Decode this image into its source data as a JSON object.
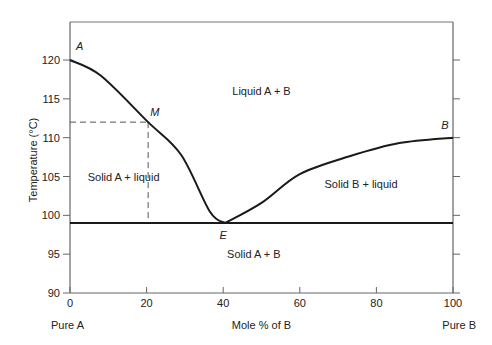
{
  "chart_data": {
    "type": "line",
    "title": "",
    "xlabel": "Mole % of B",
    "ylabel": "Temperature (°C)",
    "xlim": [
      0,
      100
    ],
    "ylim": [
      90,
      125
    ],
    "x_ticks": [
      0,
      20,
      40,
      60,
      80,
      100
    ],
    "y_ticks": [
      90,
      95,
      100,
      105,
      110,
      115,
      120
    ],
    "x_end_labels": {
      "left": "Pure A",
      "right": "Pure B"
    },
    "grid": false,
    "series": [
      {
        "name": "liquidus-A",
        "x": [
          0,
          8,
          20.4,
          29,
          36.5,
          40.5
        ],
        "y": [
          120,
          118,
          112,
          107.8,
          100.5,
          99
        ]
      },
      {
        "name": "liquidus-B",
        "x": [
          40.5,
          50,
          60,
          73,
          86,
          100
        ],
        "y": [
          99,
          101.6,
          105.3,
          107.6,
          109.3,
          110
        ]
      },
      {
        "name": "eutectic-line",
        "x": [
          0,
          100
        ],
        "y": [
          99,
          99
        ]
      }
    ],
    "reference_lines": {
      "M_temperature": 112,
      "M_composition": 20.4,
      "style": "dashed"
    },
    "points": [
      {
        "label": "A",
        "x": 0,
        "y": 120
      },
      {
        "label": "M",
        "x": 20.4,
        "y": 112
      },
      {
        "label": "E",
        "x": 40.5,
        "y": 99
      },
      {
        "label": "B",
        "x": 100,
        "y": 110
      }
    ],
    "regions": [
      {
        "label": "Liquid A + B",
        "x": 50,
        "y": 116
      },
      {
        "label": "Solid A + liquid",
        "x": 14,
        "y": 105
      },
      {
        "label": "Solid B + liquid",
        "x": 76,
        "y": 104
      },
      {
        "label": "Solid A + B",
        "x": 48,
        "y": 95
      }
    ]
  }
}
